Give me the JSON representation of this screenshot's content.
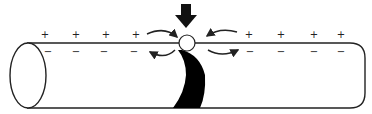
{
  "diagram": {
    "colors": {
      "stroke": "#222222",
      "fill": "#000000",
      "background": "#ffffff"
    },
    "outside_charges": {
      "left": [
        "+",
        "+",
        "+",
        "+"
      ],
      "right": [
        "+",
        "+",
        "+",
        "+"
      ]
    },
    "inside_charges": {
      "left": [
        "−",
        "−",
        "−",
        "−"
      ],
      "right": [
        "−",
        "−",
        "−",
        "−"
      ]
    },
    "icons": {
      "stimulus_arrow": "down-arrow-icon",
      "depolarized_site": "circle-icon",
      "current_flow_arrows": "curved-arrow-icon",
      "depolarized_band": "black-crescent-band"
    }
  }
}
